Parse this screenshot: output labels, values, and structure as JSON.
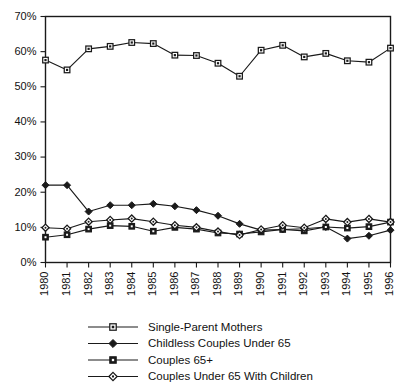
{
  "chart_data": {
    "type": "line",
    "title": "",
    "subtitle": "",
    "xlabel": "",
    "ylabel": "",
    "x": [
      1980,
      1981,
      1982,
      1983,
      1984,
      1985,
      1986,
      1987,
      1988,
      1989,
      1990,
      1991,
      1992,
      1993,
      1994,
      1995,
      1996
    ],
    "categories": [
      "1980",
      "1981",
      "1982",
      "1983",
      "1984",
      "1985",
      "1986",
      "1987",
      "1988",
      "1989",
      "1990",
      "1991",
      "1992",
      "1993",
      "1994",
      "1995",
      "1996"
    ],
    "xlim": [
      1980,
      1996
    ],
    "ylim": [
      0,
      70
    ],
    "y_ticks": [
      0,
      10,
      20,
      30,
      40,
      50,
      60,
      70
    ],
    "y_tick_labels": [
      "0%",
      "10%",
      "20%",
      "30%",
      "40%",
      "50%",
      "60%",
      "70%"
    ],
    "grid": false,
    "legend_position": "below",
    "x_tick_rotation": 90,
    "series": [
      {
        "name": "Single-Parent Mothers",
        "marker": "open-square",
        "values": [
          57.6,
          54.8,
          60.8,
          61.5,
          62.6,
          62.3,
          59.0,
          58.9,
          56.7,
          53.0,
          60.4,
          61.8,
          58.5,
          59.5,
          57.4,
          57.0,
          61.0
        ]
      },
      {
        "name": "Childless Couples Under 65",
        "marker": "filled-diamond",
        "values": [
          22.0,
          22.0,
          14.5,
          16.3,
          16.3,
          16.7,
          16.0,
          14.9,
          13.3,
          11.0,
          9.2,
          9.4,
          9.6,
          10.1,
          6.8,
          7.6,
          9.2
        ]
      },
      {
        "name": "Couples 65+",
        "marker": "filled-square",
        "values": [
          7.2,
          7.9,
          9.5,
          10.5,
          10.3,
          8.9,
          10.0,
          9.5,
          8.4,
          8.1,
          8.7,
          9.4,
          9.0,
          10.1,
          9.8,
          10.2,
          11.5
        ]
      },
      {
        "name": "Couples Under 65 With Children",
        "marker": "open-diamond",
        "values": [
          9.9,
          9.6,
          11.6,
          12.1,
          12.5,
          11.6,
          10.6,
          10.0,
          8.8,
          7.8,
          9.4,
          10.6,
          9.9,
          12.4,
          11.5,
          12.4,
          11.5
        ]
      }
    ]
  },
  "legend": {
    "entries": [
      {
        "label": "Single-Parent Mothers",
        "marker": "open-square"
      },
      {
        "label": "Childless Couples Under 65",
        "marker": "filled-diamond"
      },
      {
        "label": "Couples 65+",
        "marker": "filled-square"
      },
      {
        "label": "Couples Under 65 With Children",
        "marker": "open-diamond"
      }
    ]
  },
  "colors": {
    "line": "#1a1a1a",
    "marker_fill_open": "#ffffff",
    "marker_fill_solid": "#1a1a1a",
    "axis": "#1a1a1a",
    "background": "#ffffff",
    "text": "#111111"
  }
}
